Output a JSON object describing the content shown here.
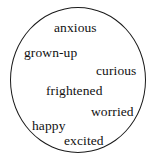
{
  "diagram": {
    "type": "word-cloud-in-circle",
    "shape": "circle",
    "background_color": "#ffffff",
    "stroke_color": "#1a1a1a",
    "text_color": "#111111",
    "words": [
      {
        "label": "anxious"
      },
      {
        "label": "grown-up"
      },
      {
        "label": "curious"
      },
      {
        "label": "frightened"
      },
      {
        "label": "worried"
      },
      {
        "label": "happy"
      },
      {
        "label": "excited"
      }
    ]
  }
}
